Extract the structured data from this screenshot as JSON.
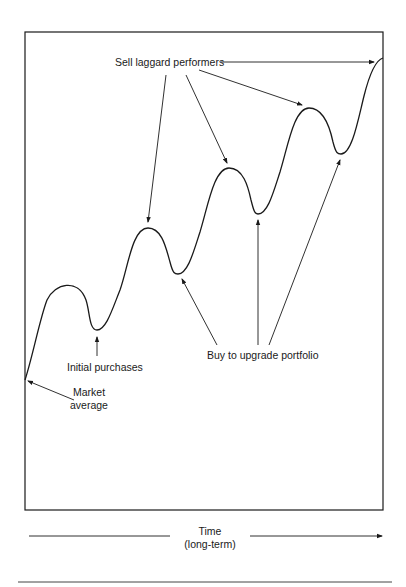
{
  "diagram": {
    "title": "",
    "labels": {
      "sell": "Sell laggard performers",
      "initial": "Initial purchases",
      "market_line1": "Market",
      "market_line2": "average",
      "buy": "Buy to upgrade portfolio",
      "time_line1": "Time",
      "time_line2": "(long-term)"
    },
    "curve_points": [
      {
        "name": "start",
        "x": 25,
        "y": 380
      },
      {
        "name": "peak1",
        "x": 67,
        "y": 285
      },
      {
        "name": "trough1",
        "x": 97,
        "y": 330
      },
      {
        "name": "peak2",
        "x": 148,
        "y": 228
      },
      {
        "name": "trough2",
        "x": 178,
        "y": 274
      },
      {
        "name": "peak3",
        "x": 229,
        "y": 168
      },
      {
        "name": "trough3",
        "x": 258,
        "y": 214
      },
      {
        "name": "peak4",
        "x": 309,
        "y": 108
      },
      {
        "name": "trough4",
        "x": 341,
        "y": 154
      },
      {
        "name": "end",
        "x": 383,
        "y": 58
      }
    ],
    "colors": {
      "line": "#1a1a1a",
      "background": "#ffffff"
    }
  }
}
